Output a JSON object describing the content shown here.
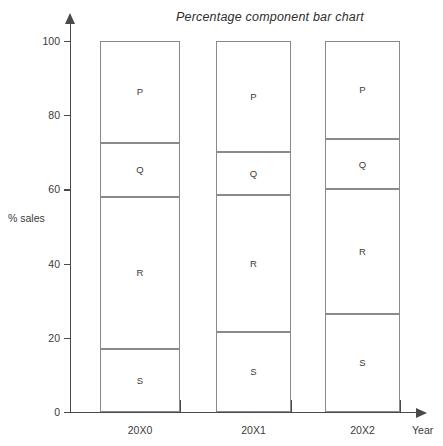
{
  "chart_data": {
    "type": "bar",
    "subtype": "percentage-component-stacked-bar",
    "title": "Percentage component bar chart",
    "xlabel": "Year",
    "ylabel": "% sales",
    "categories": [
      "20X0",
      "20X1",
      "20X2"
    ],
    "ylim": [
      0,
      100
    ],
    "yticks": [
      0,
      20,
      40,
      60,
      80,
      100
    ],
    "ytick_labels": [
      "0",
      "20",
      "40",
      "60",
      "80",
      "100"
    ],
    "grid": false,
    "legend": "none (segments labelled in place)",
    "stack_order_bottom_to_top": [
      "S",
      "R",
      "Q",
      "P"
    ],
    "series": [
      {
        "name": "S",
        "values": [
          17.0,
          21.5,
          26.5
        ]
      },
      {
        "name": "R",
        "values": [
          41.0,
          37.0,
          33.5
        ]
      },
      {
        "name": "Q",
        "values": [
          14.5,
          11.5,
          13.5
        ]
      },
      {
        "name": "P",
        "values": [
          27.5,
          30.0,
          26.5
        ]
      }
    ],
    "cumulative_boundaries": {
      "20X0": [
        0,
        17.0,
        58.0,
        72.5,
        100
      ],
      "20X1": [
        0,
        21.5,
        58.5,
        70.0,
        100
      ],
      "20X2": [
        0,
        26.5,
        60.0,
        73.5,
        100
      ]
    },
    "colors": {
      "segment_fill": "#ffffff",
      "segment_border": "#8a8a8a",
      "axis": "#4a4a4a",
      "text": "#3a3a3a",
      "background": "#ffffff"
    }
  },
  "bars": [
    {
      "category": "20X0",
      "left_px": 100,
      "width_px": 80,
      "segments": [
        {
          "label": "P",
          "value": 27.5,
          "from": 72.5,
          "to": 100
        },
        {
          "label": "Q",
          "value": 14.5,
          "from": 58.0,
          "to": 72.5
        },
        {
          "label": "R",
          "value": 41.0,
          "from": 17.0,
          "to": 58.0
        },
        {
          "label": "S",
          "value": 17.0,
          "from": 0,
          "to": 17.0
        }
      ]
    },
    {
      "category": "20X1",
      "left_px": 216,
      "width_px": 75,
      "segments": [
        {
          "label": "P",
          "value": 30.0,
          "from": 70.0,
          "to": 100
        },
        {
          "label": "Q",
          "value": 11.5,
          "from": 58.5,
          "to": 70.0
        },
        {
          "label": "R",
          "value": 37.0,
          "from": 21.5,
          "to": 58.5
        },
        {
          "label": "S",
          "value": 21.5,
          "from": 0,
          "to": 21.5
        }
      ]
    },
    {
      "category": "20X2",
      "left_px": 325,
      "width_px": 75,
      "segments": [
        {
          "label": "P",
          "value": 26.5,
          "from": 73.5,
          "to": 100
        },
        {
          "label": "Q",
          "value": 13.5,
          "from": 60.0,
          "to": 73.5
        },
        {
          "label": "R",
          "value": 33.5,
          "from": 26.5,
          "to": 60.0
        },
        {
          "label": "S",
          "value": 26.5,
          "from": 0,
          "to": 26.5
        }
      ]
    }
  ],
  "x_tick_positions_px": [
    100,
    180,
    216,
    291,
    325,
    400
  ]
}
